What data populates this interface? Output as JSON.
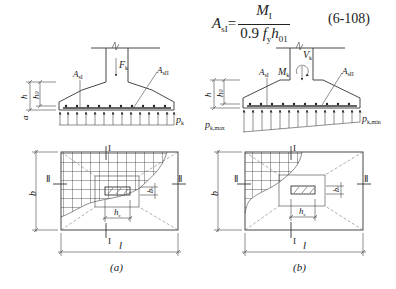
{
  "formula": {
    "lhs": "A",
    "lhs_sub": "sI",
    "equals": "=",
    "numerator": "M",
    "numerator_sub": "I",
    "denominator_prefix": "0.9 ",
    "denominator_f": "f",
    "denominator_f_sub": "y",
    "denominator_h": "h",
    "denominator_h_sub": "01",
    "equation_number": "(6-108)"
  },
  "figure_a": {
    "caption": "(a)",
    "elevation": {
      "load_label": "F",
      "load_sub": "k",
      "rebar_left_label": "A",
      "rebar_left_sub": "sI",
      "rebar_right_label": "A",
      "rebar_right_sub": "sII",
      "pressure_label": "p",
      "pressure_sub": "k",
      "dim_h": "h",
      "dim_h0": "h",
      "dim_h0_sub": "0",
      "dim_a": "a"
    },
    "plan": {
      "dim_b": "b",
      "dim_l": "l",
      "dim_bc": "b",
      "dim_bc_sub": "c",
      "dim_hc": "h",
      "dim_hc_sub": "c",
      "section_I_top": "I",
      "section_I_bottom": "I",
      "section_II_left": "Ⅱ",
      "section_II_right": "Ⅱ"
    }
  },
  "figure_b": {
    "caption": "(b)",
    "elevation": {
      "vertical_load_label": "V",
      "vertical_load_sub": "k",
      "moment_label": "M",
      "moment_sub": "k",
      "rebar_left_label": "A",
      "rebar_left_sub": "sI",
      "rebar_right_label": "A",
      "rebar_right_sub": "sII",
      "pressure_max_label": "p",
      "pressure_max_sub": "k,max",
      "pressure_min_label": "p",
      "pressure_min_sub": "k,min",
      "dim_h": "h",
      "dim_h0": "h",
      "dim_h0_sub": "0"
    },
    "plan": {
      "dim_b": "b",
      "dim_l": "l",
      "dim_bc": "b",
      "dim_bc_sub": "c",
      "dim_hc": "h",
      "dim_hc_sub": "c",
      "section_I_top": "I",
      "section_I_bottom": "I",
      "section_II_left": "Ⅱ",
      "section_II_right": "Ⅱ"
    }
  }
}
